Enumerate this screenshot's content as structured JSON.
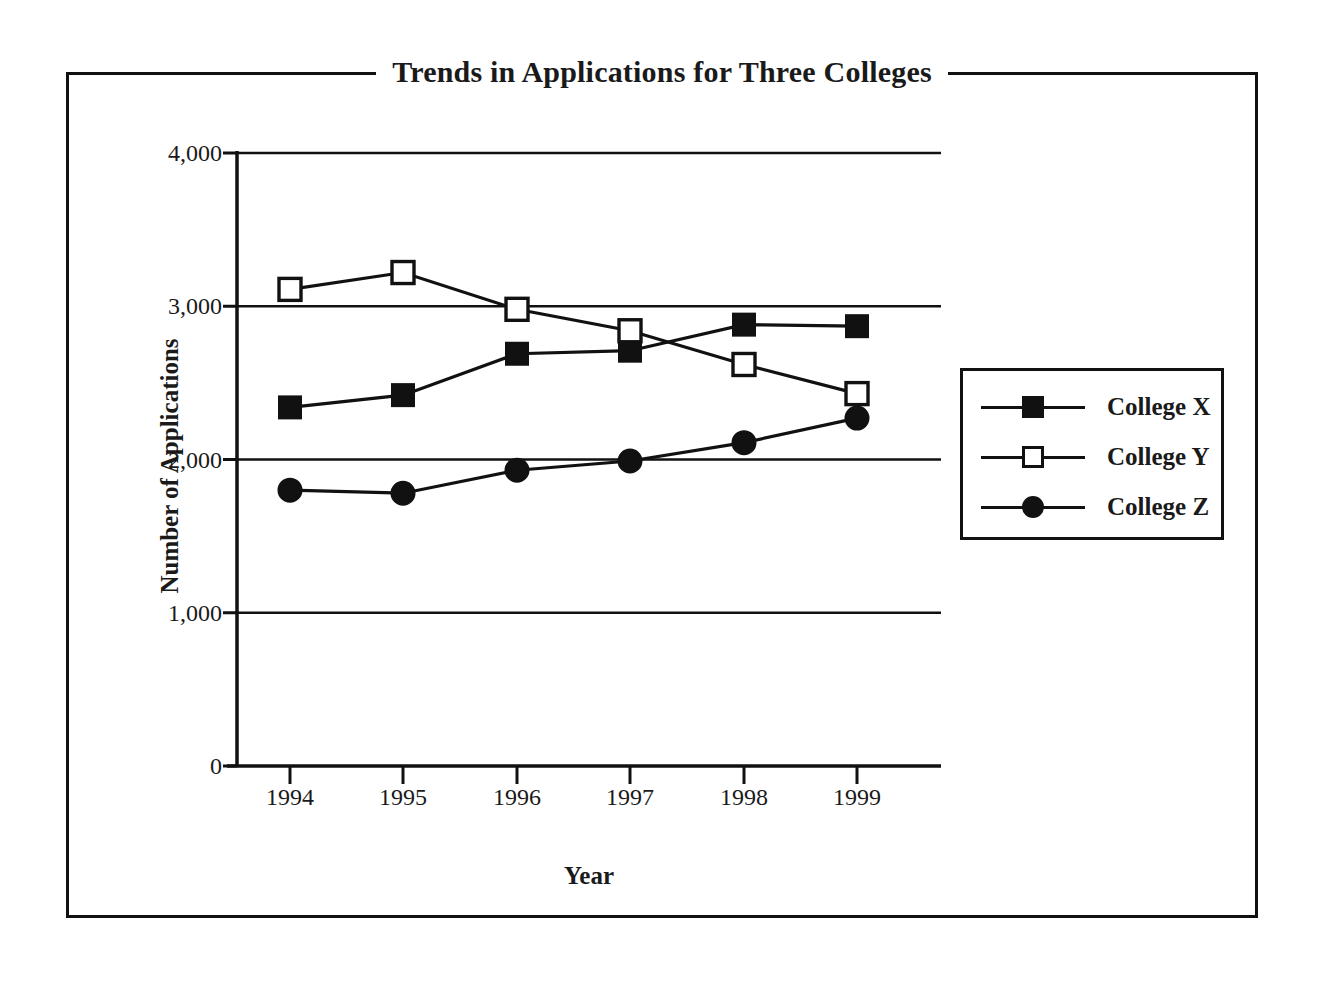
{
  "chart_data": {
    "type": "line",
    "title": "Trends in Applications for Three Colleges",
    "xlabel": "Year",
    "ylabel": "Number of Applications",
    "categories": [
      "1994",
      "1995",
      "1996",
      "1997",
      "1998",
      "1999"
    ],
    "x": [
      1994,
      1995,
      1996,
      1997,
      1998,
      1999
    ],
    "series": [
      {
        "name": "College X",
        "marker": "filled-square",
        "color": "#111111",
        "values": [
          2340,
          2420,
          2690,
          2710,
          2880,
          2870
        ]
      },
      {
        "name": "College Y",
        "marker": "open-square",
        "color": "#111111",
        "values": [
          3110,
          3220,
          2980,
          2840,
          2620,
          2430
        ]
      },
      {
        "name": "College Z",
        "marker": "filled-circle",
        "color": "#111111",
        "values": [
          1800,
          1780,
          1930,
          1990,
          2110,
          2270
        ]
      }
    ],
    "ylim": [
      0,
      4000
    ],
    "yticks": [
      0,
      1000,
      2000,
      3000,
      4000
    ],
    "ytick_labels": [
      "0",
      "1,000",
      "2,000",
      "3,000",
      "4,000"
    ],
    "grid": "horizontal",
    "legend_position": "right",
    "legend_entries": [
      "College X",
      "College Y",
      "College Z"
    ]
  }
}
